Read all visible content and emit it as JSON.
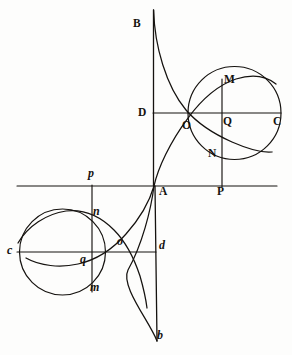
{
  "figure": {
    "stroke_color": "#15120f",
    "background_color": "#fdfdfc",
    "width": 292,
    "height": 355
  },
  "labels": [
    {
      "id": "B",
      "text": "B",
      "style": "cap",
      "x": 133,
      "y": 18
    },
    {
      "id": "D",
      "text": "D",
      "style": "cap",
      "x": 138,
      "y": 107
    },
    {
      "id": "M",
      "text": "M",
      "style": "cap",
      "x": 224,
      "y": 74
    },
    {
      "id": "O",
      "text": "O",
      "style": "cap",
      "x": 182,
      "y": 120
    },
    {
      "id": "Q",
      "text": "Q",
      "style": "cap",
      "x": 223,
      "y": 116
    },
    {
      "id": "C",
      "text": "C",
      "style": "cap",
      "x": 273,
      "y": 116
    },
    {
      "id": "N",
      "text": "N",
      "style": "cap",
      "x": 208,
      "y": 148
    },
    {
      "id": "A",
      "text": "A",
      "style": "cap",
      "x": 159,
      "y": 186
    },
    {
      "id": "P",
      "text": "P",
      "style": "cap",
      "x": 217,
      "y": 186
    },
    {
      "id": "p",
      "text": "p",
      "style": "ital",
      "x": 88,
      "y": 167
    },
    {
      "id": "n",
      "text": "n",
      "style": "ital",
      "x": 93,
      "y": 205
    },
    {
      "id": "o",
      "text": "o",
      "style": "ital",
      "x": 117,
      "y": 235
    },
    {
      "id": "c",
      "text": "c",
      "style": "ital",
      "x": 7,
      "y": 244
    },
    {
      "id": "d",
      "text": "d",
      "style": "ital",
      "x": 159,
      "y": 239
    },
    {
      "id": "q",
      "text": "q",
      "style": "ital",
      "x": 80,
      "y": 253
    },
    {
      "id": "m",
      "text": "m",
      "style": "ital",
      "x": 90,
      "y": 281
    },
    {
      "id": "b",
      "text": "b",
      "style": "ital",
      "x": 157,
      "y": 329
    }
  ],
  "geometry": {
    "axis_horizontal": {
      "name": "base-line",
      "x1": 17,
      "y1": 186,
      "x2": 277,
      "y2": 186
    },
    "axis_vertical_upper": {
      "name": "asymptote-BA",
      "x1": 153.5,
      "y1": 10,
      "x2": 153.5,
      "y2": 186
    },
    "axis_vertical_lower": {
      "name": "asymptote-Ab",
      "x1": 155,
      "y1": 186,
      "x2": 157,
      "y2": 341
    },
    "chord_DC": {
      "name": "line-DC",
      "x1": 153,
      "y1": 113,
      "x2": 281,
      "y2": 113
    },
    "chord_cd": {
      "name": "line-cd",
      "x1": 17,
      "y1": 252,
      "x2": 156,
      "y2": 252
    },
    "ordinate_MP": {
      "name": "ordinate-M-N-P",
      "x1": 222,
      "y1": 79,
      "x2": 222,
      "y2": 187
    },
    "ordinate_pm": {
      "name": "ordinate-p-n-q-m",
      "x1": 92,
      "y1": 185,
      "x2": 92,
      "y2": 292
    },
    "circle_right": {
      "name": "generating-circle-right",
      "cx": 234.5,
      "cy": 113,
      "r": 46.5
    },
    "circle_left": {
      "name": "generating-circle-left",
      "cx": 62.5,
      "cy": 252,
      "r": 43
    }
  },
  "points": {
    "A": {
      "x": 154,
      "y": 186
    },
    "B": {
      "x": 153.5,
      "y": 10
    },
    "b": {
      "x": 157,
      "y": 341
    },
    "D": {
      "x": 153,
      "y": 113
    },
    "C": {
      "x": 281,
      "y": 113
    },
    "O": {
      "x": 188,
      "y": 114
    },
    "Q": {
      "x": 222,
      "y": 113
    },
    "M": {
      "x": 222,
      "y": 79
    },
    "N": {
      "x": 222,
      "y": 152
    },
    "P": {
      "x": 222,
      "y": 186
    },
    "c": {
      "x": 17,
      "y": 252
    },
    "d": {
      "x": 156,
      "y": 252
    },
    "o": {
      "x": 122,
      "y": 253
    },
    "q": {
      "x": 92,
      "y": 252
    },
    "n": {
      "x": 92,
      "y": 217
    },
    "m": {
      "x": 92,
      "y": 290
    },
    "p": {
      "x": 92,
      "y": 186
    }
  }
}
